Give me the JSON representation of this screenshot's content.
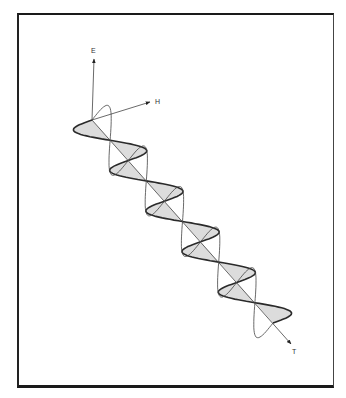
{
  "diagram": {
    "type": "electromagnetic-wave",
    "labels": {
      "e_axis": "E",
      "h_axis": "H",
      "t_axis": "T"
    },
    "colors": {
      "frame": "#1a1a1a",
      "line": "#333333",
      "shade": "#dcdcdc",
      "background": "#ffffff"
    },
    "geometry": {
      "origin": [
        92,
        120
      ],
      "e_arrow_tip": [
        94,
        59
      ],
      "e_label_pos": [
        91,
        53
      ],
      "h_arrow_tip": [
        150,
        102
      ],
      "h_label_pos": [
        155,
        104
      ],
      "t_arrow_tip": [
        291,
        344
      ],
      "t_label_pos": [
        292,
        354
      ],
      "half_wave_step": [
        18.1,
        20.3
      ],
      "half_waves": 10,
      "h_amplitude": [
        -27,
        1
      ],
      "e_amplitude": [
        8,
        -24
      ]
    }
  }
}
